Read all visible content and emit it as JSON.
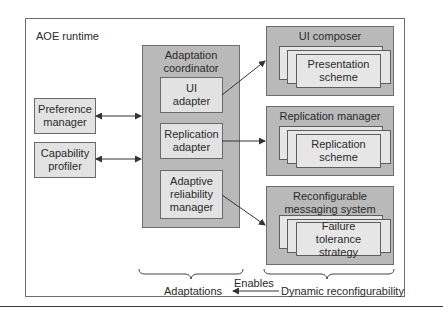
{
  "diagram": {
    "container_label": "AOE runtime",
    "left_components": [
      {
        "label": "Preference manager"
      },
      {
        "label": "Capability profiler"
      }
    ],
    "coordinator": {
      "title": "Adaptation coordinator",
      "adapters": [
        {
          "label": "UI adapter"
        },
        {
          "label": "Replication adapter"
        },
        {
          "label": "Adaptive reliability manager"
        }
      ]
    },
    "right_components": [
      {
        "title": "UI composer",
        "inner": "Presentation scheme"
      },
      {
        "title": "Replication manager",
        "inner": "Replication scheme"
      },
      {
        "title": "Reconfigurable messaging system",
        "inner": "Failure tolerance strategy"
      }
    ],
    "bottom": {
      "left_brace_label": "Adaptations",
      "arrow_label": "Enables",
      "right_brace_label": "Dynamic reconfigurability"
    }
  }
}
